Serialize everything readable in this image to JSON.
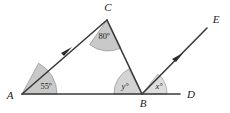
{
  "figure": {
    "background_color": "#ffffff",
    "line_color": "#3a3a3a",
    "sector_fill_dark": "#c9c9c9",
    "sector_fill_light": "#dedede",
    "text_color": "#1b1b1b"
  },
  "vertices": {
    "a": {
      "label": "A",
      "x": 22,
      "y": 94
    },
    "b": {
      "label": "B",
      "x": 142,
      "y": 94
    },
    "c": {
      "label": "C",
      "x": 107,
      "y": 20
    },
    "d": {
      "label": "D",
      "x": 180,
      "y": 94
    },
    "e": {
      "label": "E",
      "x": 207,
      "y": 28
    }
  },
  "angles": {
    "at_a": {
      "label": "55º",
      "value": 55,
      "unit": "degrees",
      "vertex": "A"
    },
    "at_c": {
      "label": "80º",
      "value": 80,
      "unit": "degrees",
      "vertex": "C"
    },
    "at_b_left": {
      "label": "y°",
      "value": "y",
      "unit": "degrees",
      "vertex": "B"
    },
    "at_b_right": {
      "label": "x°",
      "value": "x",
      "unit": "degrees",
      "vertex": "B"
    }
  },
  "segments": [
    {
      "name": "base-line-AD",
      "from": "A",
      "to": "D"
    },
    {
      "name": "ray-AC",
      "from": "A",
      "to": "C",
      "arrow": true
    },
    {
      "name": "segment-CB",
      "from": "C",
      "to": "B"
    },
    {
      "name": "ray-BE",
      "from": "B",
      "to": "E",
      "arrow": true
    }
  ]
}
